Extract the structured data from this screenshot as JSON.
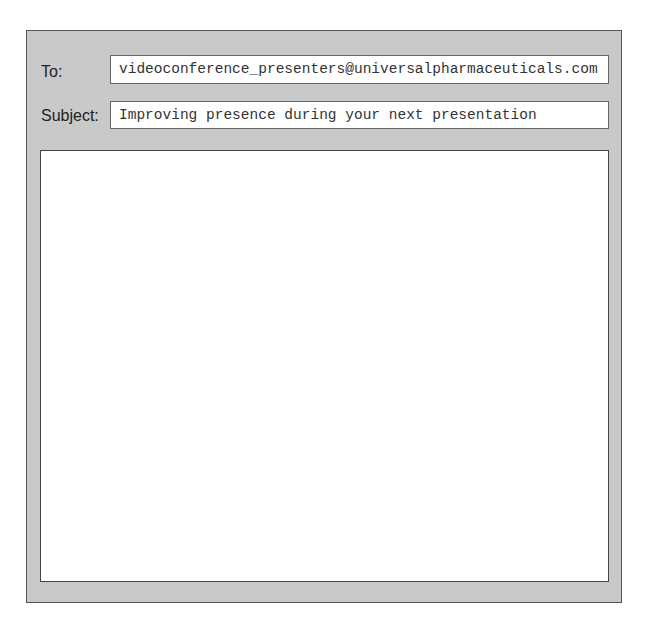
{
  "compose": {
    "to_label": "To:",
    "to_value": "videoconference_presenters@universalpharmaceuticals.com",
    "subject_label": "Subject:",
    "subject_value": "Improving presence during your next presentation",
    "body_value": ""
  }
}
